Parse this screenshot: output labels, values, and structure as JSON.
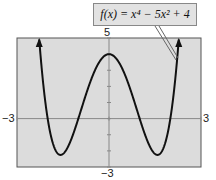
{
  "chart_data": {
    "type": "line",
    "title": "",
    "function": "f(x) = x^4 - 5x^2 + 4",
    "annotation": "f(x) = x⁴ − 5x² + 4",
    "xlabel": "",
    "ylabel": "",
    "xlim": [
      -3,
      3
    ],
    "ylim": [
      -3,
      5
    ],
    "tick_labels": {
      "x_min": "−3",
      "x_max": "3",
      "y_min": "−3",
      "y_max": "5"
    },
    "grid": false,
    "series": [
      {
        "name": "f(x)",
        "x": [
          -2.5,
          -2,
          -1.58,
          -1,
          0,
          1,
          1.58,
          2,
          2.5
        ],
        "y": [
          13.3,
          0,
          -2.25,
          0,
          4,
          0,
          -2.25,
          0,
          13.3
        ]
      }
    ],
    "colors": {
      "plot_bg": "#dcdcdc",
      "curve": "#111111",
      "axis": "#777777"
    }
  }
}
